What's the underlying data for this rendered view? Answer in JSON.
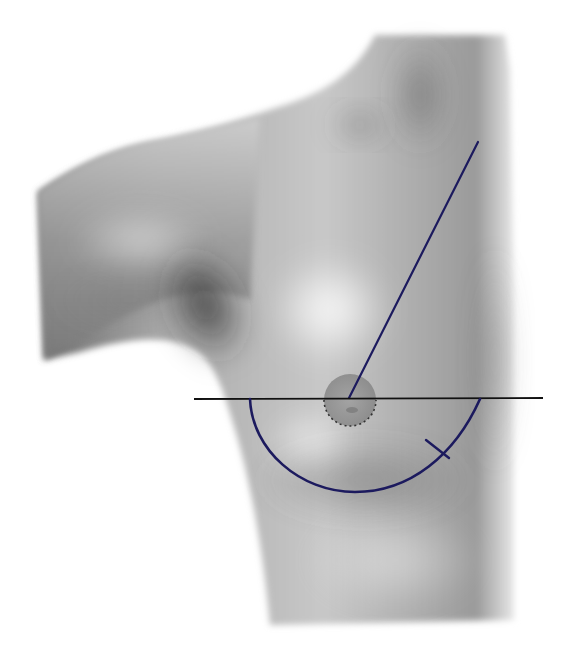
{
  "figure": {
    "title": "",
    "background": "#ffffff",
    "skin_base": "#b8b8b8"
  },
  "colors": {
    "marking_navy": "#1c1a5e",
    "marking_black": "#111111",
    "areola": "#8e8e8e"
  },
  "markings": {
    "sternal_notch_to_nipple_line": {
      "x1": 478,
      "y1": 142,
      "x2": 349,
      "y2": 398
    },
    "horizontal_nipple_line": {
      "x1": 194,
      "y1": 399,
      "x2": 543,
      "y2": 398
    },
    "inframammary_arc": {
      "start": [
        250,
        399
      ],
      "end": [
        480,
        399
      ],
      "bottom_y": 492
    },
    "arc_tick_mark": {
      "x1": 426,
      "y1": 440,
      "x2": 449,
      "y2": 458
    },
    "areola": {
      "cx": 350,
      "cy": 400,
      "r": 26
    }
  }
}
